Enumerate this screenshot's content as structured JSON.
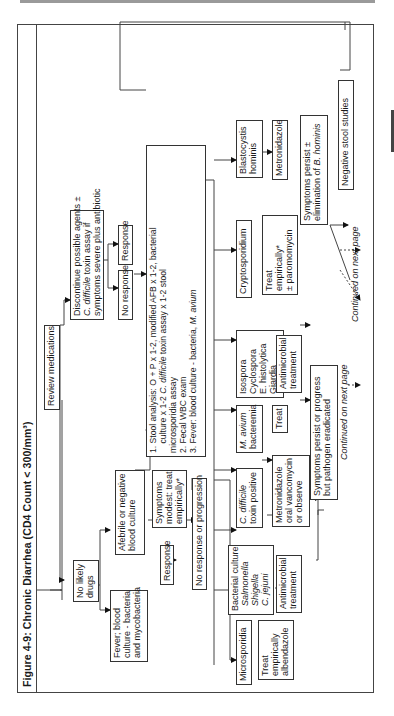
{
  "figure": {
    "title_prefix": "Figure 4-9: ",
    "title_main": "Chronic Diarrhea (CD4 Count < 300/mm³)"
  },
  "nodes": {
    "review_medications": "Review medications",
    "discontinue": [
      "Discontinue possible agents ±",
      "C. difficile toxin assay if",
      "symptoms severe plus antibiotic"
    ],
    "response_top": "Response",
    "no_response_top": "No response",
    "no_likely_drugs": [
      "No likely",
      "drugs"
    ],
    "fever_blood_culture": [
      "Fever; blood",
      "culture - bacteria",
      "and mycobacteria"
    ],
    "afebrile": [
      "Afebrile or negative",
      "blood culture"
    ],
    "symptoms_modest": [
      "Symptoms",
      "modest: treat",
      "empirically*"
    ],
    "response_left": "Response",
    "no_response_progression": "No response or progression",
    "stool_workup": [
      "1. Stool analysis: O + P x 1-2, modified AFB x 1-2, bacterial",
      "    culture x 1-2 C. difficile toxin assay x 1-2 stool",
      "    microsporidia assay",
      "2. Fecal WBC exam",
      "3. Fever: blood culture - bacteria, M. avium"
    ],
    "microsporidia": "Microsporidia",
    "treat_albendazole": [
      "Treat",
      "empirically",
      "albendazole"
    ],
    "bacterial_culture": [
      "Bacterial culture",
      "Salmonella",
      "Shigella",
      "C. jejuni"
    ],
    "antimicrobial_treatment_1": [
      "Antimicrobial",
      "treatment"
    ],
    "c_difficile": [
      "C. difficile",
      "toxin positive"
    ],
    "metronidazole_vanco": [
      "Metronidazole",
      "oral vancomycin",
      "or observe"
    ],
    "m_avium": [
      "M. avium",
      "bacteremia"
    ],
    "treat": "Treat",
    "isospora": [
      "Isospora",
      "Cyclospora",
      "E. histolytica",
      "Giardia"
    ],
    "antimicrobial_treatment_2": [
      "Antimicrobial",
      "treatment"
    ],
    "cryptosporidium": "Cryptosporidium",
    "treat_paromomycin": [
      "Treat",
      "empirically*",
      "± paromomycin"
    ],
    "blastocystis": [
      "Blastocystis",
      "hominis"
    ],
    "metronidazole": "Metronidazole",
    "symptoms_persist_bhominis": [
      "Symptoms persist ±",
      "elimination of B. hominis"
    ],
    "symptoms_persist_pathogen": [
      "Symptoms persist or progress",
      "but pathogen eradicated"
    ],
    "negative_stool": "Negative stool studies"
  },
  "notes": {
    "continued_1": "Continued on next page",
    "continued_2": "Continued on next page"
  }
}
